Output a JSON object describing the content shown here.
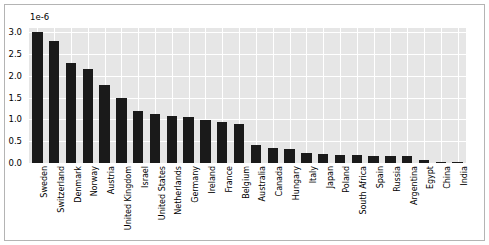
{
  "chart_data": {
    "type": "bar",
    "title": "",
    "xlabel": "",
    "ylabel": "",
    "exponent_label": "1e-6",
    "ylim": [
      0.0,
      3.1
    ],
    "ytick_labels": [
      "0.0",
      "0.5",
      "1.0",
      "1.5",
      "2.0",
      "2.5",
      "3.0"
    ],
    "ytick_values": [
      0.0,
      0.5,
      1.0,
      1.5,
      2.0,
      2.5,
      3.0
    ],
    "grid": true,
    "legend": false,
    "bar_color": "#1a1a1a",
    "plot_background": "#e6e6e6",
    "gridline_color": "#ffffff",
    "categories": [
      "Sweden",
      "Switzerland",
      "Denmark",
      "Norway",
      "Austria",
      "United Kingdom",
      "Israel",
      "United States",
      "Netherlands",
      "Germany",
      "Ireland",
      "France",
      "Belgium",
      "Australia",
      "Canada",
      "Hungary",
      "Italy",
      "Japan",
      "Poland",
      "South Africa",
      "Spain",
      "Russia",
      "Argentina",
      "Egypt",
      "China",
      "India"
    ],
    "values": [
      3.0,
      2.8,
      2.3,
      2.15,
      1.78,
      1.5,
      1.2,
      1.12,
      1.08,
      1.05,
      0.98,
      0.95,
      0.9,
      0.42,
      0.35,
      0.33,
      0.22,
      0.2,
      0.19,
      0.18,
      0.17,
      0.16,
      0.15,
      0.06,
      0.015,
      0.01
    ]
  }
}
